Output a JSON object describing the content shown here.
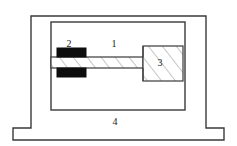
{
  "figure": {
    "background_color": "#ffffff",
    "line_color": "#3a3a3a",
    "hatch_color": "#8a8a8a",
    "clamp_color": "#0d0d0d",
    "label_color": "#1a1a1a",
    "width": 237,
    "height": 146
  },
  "labels": {
    "beam": "1",
    "clamp": "2",
    "mass": "3",
    "frame": "4"
  },
  "parts": [
    {
      "id": "1",
      "name": "beam",
      "label": "1",
      "description": "hatched cantilever beam",
      "label_x": 114,
      "label_y": 45
    },
    {
      "id": "2",
      "name": "clamp",
      "label": "2",
      "description": "black clamping blocks",
      "label_x": 69,
      "label_y": 45
    },
    {
      "id": "3",
      "name": "mass-block",
      "label": "3",
      "description": "hatched end mass block",
      "label_x": 159,
      "label_y": 64
    },
    {
      "id": "4",
      "name": "support-frame",
      "label": "4",
      "description": "outer support frame with stepped base",
      "label_x": 115,
      "label_y": 123
    }
  ],
  "geometry": {
    "outer_frame_path": "M 13 140 L 13 128 L 31 128 L 31 16 L 206 16 L 206 128 L 224 128 L 224 140 Z",
    "inner_chamber": {
      "x": 51,
      "y": 22,
      "width": 134,
      "height": 88
    },
    "beam": {
      "x": 51,
      "y": 57,
      "width": 92,
      "height": 11
    },
    "clamp_upper": {
      "x": 57,
      "y": 48,
      "width": 29,
      "height": 9
    },
    "clamp_lower": {
      "x": 57,
      "y": 68,
      "width": 29,
      "height": 9
    },
    "mass_block": {
      "x": 143,
      "y": 46,
      "width": 40,
      "height": 35
    }
  }
}
